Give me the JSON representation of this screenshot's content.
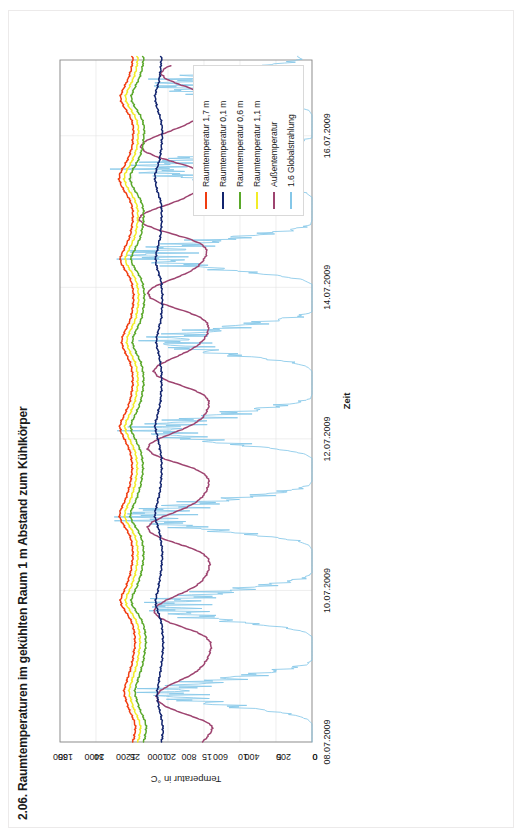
{
  "document": {
    "title": "2.06. Raumtemperaturen im gekühlten Raum 1 m Abstand zum Kühlkörper",
    "orientation": "rotated-90-ccw"
  },
  "legend": {
    "position": "top-right",
    "items": [
      {
        "label": "Raumtemperatur 1,7 m",
        "color": "#f03c10"
      },
      {
        "label": "Raumtemperatur 0,1 m",
        "color": "#12246e"
      },
      {
        "label": "Raumtemperatur 0,6 m",
        "color": "#5aa82a"
      },
      {
        "label": "Raumtemperatur 1,1 m",
        "color": "#f2ec28"
      },
      {
        "label": "Außentemperatur",
        "color": "#9e4470"
      },
      {
        "label": "1.6 Globalstrahlung",
        "color": "#85c7e8"
      }
    ]
  },
  "chart_data": {
    "type": "line",
    "title": "2.06. Raumtemperaturen im gekühlten Raum 1 m Abstand zum Kühlkörper",
    "xlabel": "Zeit",
    "ylabel": "Temperatur in °C",
    "y2label": "",
    "grid": true,
    "legend_position": "top-right",
    "x_ticks": [
      "08.07.2009",
      "10.07.2009",
      "12.07.2009",
      "14.07.2009",
      "16.07.2009"
    ],
    "x_range": [
      "08.07.2009",
      "17.07.2009"
    ],
    "ylim": [
      0,
      35
    ],
    "y_ticks": [
      0,
      5,
      10,
      15,
      20,
      25,
      30,
      35
    ],
    "y2lim": [
      0,
      1600
    ],
    "y2_ticks": [
      0,
      200,
      400,
      600,
      800,
      1000,
      1200,
      1400,
      1600
    ],
    "x_days": [
      0,
      2,
      4,
      6,
      8
    ],
    "series": [
      {
        "name": "Raumtemperatur 1,7 m",
        "color": "#f03c10",
        "axis": "left",
        "unit": "°C",
        "values": [
          24.9,
          24.7,
          24.6,
          24.5,
          24.6,
          24.8,
          25.1,
          25.4,
          25.6,
          25.8,
          26.0,
          26.1,
          26.0,
          25.8,
          25.6,
          25.4,
          25.2,
          25.0,
          24.9,
          24.8,
          24.7,
          24.6,
          24.6,
          24.6,
          24.7,
          24.8,
          25.0,
          25.3,
          25.7,
          26.1,
          26.5,
          26.6,
          26.4,
          26.1,
          25.8,
          25.6,
          25.4,
          25.2,
          25.1,
          25.0,
          24.9,
          24.9,
          24.9,
          25.0,
          25.1,
          25.3,
          25.6,
          26.0,
          26.4,
          26.7,
          26.7,
          26.5,
          26.2,
          25.9,
          25.7,
          25.5,
          25.3,
          25.2,
          25.1,
          25.0,
          25.0,
          25.0,
          25.1,
          25.2,
          25.4,
          25.7,
          26.0,
          26.3,
          26.6,
          26.7,
          26.5,
          26.2,
          25.9,
          25.6,
          25.4,
          25.2,
          25.1,
          25.0,
          24.9,
          24.9,
          24.9,
          25.0,
          25.1,
          25.3,
          25.6,
          25.9,
          26.2,
          26.4,
          26.4,
          26.2,
          25.9,
          25.6,
          25.3,
          25.1,
          25.0,
          24.9,
          24.8,
          24.8,
          24.8,
          24.9,
          25.0,
          25.2,
          25.5,
          25.9,
          26.3,
          26.6,
          26.6,
          26.3,
          26.0,
          25.7,
          25.4,
          25.2,
          25.1,
          25.0,
          24.9,
          24.9,
          24.9,
          25.0,
          25.2,
          25.5,
          25.9,
          26.3,
          26.6,
          26.8,
          26.7,
          26.4,
          26.0,
          25.7,
          25.4,
          25.2,
          25.0,
          24.9,
          24.9,
          24.8,
          24.8,
          24.9,
          25.1,
          25.4,
          25.8,
          26.2,
          26.5,
          26.6,
          26.4,
          26.1,
          25.8,
          25.5,
          25.3,
          25.1,
          25.0,
          24.9
        ]
      },
      {
        "name": "Raumtemperatur 1,1 m",
        "color": "#f2ec28",
        "axis": "left",
        "unit": "°C",
        "values": [
          24.2,
          24.0,
          23.9,
          23.8,
          23.9,
          24.1,
          24.4,
          24.7,
          24.9,
          25.1,
          25.3,
          25.4,
          25.3,
          25.1,
          24.9,
          24.7,
          24.5,
          24.3,
          24.2,
          24.1,
          24.0,
          23.9,
          23.9,
          23.9,
          24.0,
          24.1,
          24.3,
          24.6,
          25.0,
          25.4,
          25.8,
          25.9,
          25.7,
          25.4,
          25.1,
          24.9,
          24.7,
          24.5,
          24.4,
          24.3,
          24.2,
          24.2,
          24.2,
          24.3,
          24.4,
          24.6,
          24.9,
          25.3,
          25.7,
          26.0,
          26.0,
          25.8,
          25.5,
          25.2,
          25.0,
          24.8,
          24.6,
          24.5,
          24.4,
          24.3,
          24.3,
          24.3,
          24.4,
          24.5,
          24.7,
          25.0,
          25.3,
          25.6,
          25.9,
          26.0,
          25.8,
          25.5,
          25.2,
          24.9,
          24.7,
          24.5,
          24.4,
          24.3,
          24.2,
          24.2,
          24.2,
          24.3,
          24.4,
          24.6,
          24.9,
          25.2,
          25.5,
          25.7,
          25.7,
          25.5,
          25.2,
          24.9,
          24.6,
          24.4,
          24.3,
          24.2,
          24.1,
          24.1,
          24.1,
          24.2,
          24.3,
          24.5,
          24.8,
          25.2,
          25.6,
          25.9,
          25.9,
          25.6,
          25.3,
          25.0,
          24.7,
          24.5,
          24.4,
          24.3,
          24.2,
          24.2,
          24.2,
          24.3,
          24.5,
          24.8,
          25.2,
          25.6,
          25.9,
          26.1,
          26.0,
          25.7,
          25.3,
          25.0,
          24.7,
          24.5,
          24.3,
          24.2,
          24.2,
          24.1,
          24.1,
          24.2,
          24.4,
          24.7,
          25.1,
          25.5,
          25.8,
          25.9,
          25.7,
          25.4,
          25.1,
          24.8,
          24.6,
          24.4,
          24.3,
          24.2
        ]
      },
      {
        "name": "Raumtemperatur 0,6 m",
        "color": "#5aa82a",
        "axis": "left",
        "unit": "°C",
        "values": [
          23.4,
          23.2,
          23.1,
          23.0,
          23.1,
          23.3,
          23.6,
          23.9,
          24.1,
          24.3,
          24.5,
          24.6,
          24.5,
          24.3,
          24.1,
          23.9,
          23.7,
          23.5,
          23.4,
          23.3,
          23.2,
          23.1,
          23.1,
          23.1,
          23.2,
          23.3,
          23.5,
          23.8,
          24.2,
          24.6,
          25.0,
          25.1,
          24.9,
          24.6,
          24.3,
          24.1,
          23.9,
          23.7,
          23.6,
          23.5,
          23.4,
          23.4,
          23.4,
          23.5,
          23.6,
          23.8,
          24.1,
          24.5,
          24.9,
          25.2,
          25.2,
          25.0,
          24.7,
          24.4,
          24.2,
          24.0,
          23.8,
          23.7,
          23.6,
          23.5,
          23.5,
          23.5,
          23.6,
          23.7,
          23.9,
          24.2,
          24.5,
          24.8,
          25.1,
          25.2,
          25.0,
          24.7,
          24.4,
          24.1,
          23.9,
          23.7,
          23.6,
          23.5,
          23.4,
          23.4,
          23.4,
          23.5,
          23.6,
          23.8,
          24.1,
          24.4,
          24.7,
          24.9,
          24.9,
          24.7,
          24.4,
          24.1,
          23.8,
          23.6,
          23.5,
          23.4,
          23.3,
          23.3,
          23.3,
          23.4,
          23.5,
          23.7,
          24.0,
          24.4,
          24.8,
          25.1,
          25.1,
          24.8,
          24.5,
          24.2,
          23.9,
          23.7,
          23.6,
          23.5,
          23.4,
          23.4,
          23.4,
          23.5,
          23.7,
          24.0,
          24.4,
          24.8,
          25.1,
          25.3,
          25.2,
          24.9,
          24.5,
          24.2,
          23.9,
          23.7,
          23.5,
          23.4,
          23.4,
          23.3,
          23.3,
          23.4,
          23.6,
          23.9,
          24.3,
          24.7,
          25.0,
          25.1,
          24.9,
          24.6,
          24.3,
          24.0,
          23.8,
          23.6,
          23.5,
          23.4
        ]
      },
      {
        "name": "Raumtemperatur 0,1 m",
        "color": "#12246e",
        "axis": "left",
        "unit": "°C",
        "values": [
          20.9,
          20.8,
          20.7,
          20.7,
          20.8,
          20.9,
          21.0,
          21.2,
          21.3,
          21.4,
          21.5,
          21.5,
          21.4,
          21.3,
          21.2,
          21.1,
          21.0,
          20.9,
          20.8,
          20.8,
          20.7,
          20.7,
          20.7,
          20.7,
          20.8,
          20.8,
          20.9,
          21.1,
          21.3,
          21.5,
          21.7,
          21.7,
          21.6,
          21.4,
          21.3,
          21.2,
          21.1,
          21.0,
          20.9,
          20.9,
          20.8,
          20.8,
          20.8,
          20.9,
          21.0,
          21.1,
          21.2,
          21.4,
          21.6,
          21.8,
          21.8,
          21.7,
          21.5,
          21.4,
          21.2,
          21.1,
          21.0,
          21.0,
          20.9,
          20.9,
          20.9,
          20.9,
          20.9,
          21.0,
          21.1,
          21.2,
          21.4,
          21.5,
          21.7,
          21.8,
          21.7,
          21.5,
          21.4,
          21.2,
          21.1,
          21.0,
          21.0,
          20.9,
          20.9,
          20.9,
          20.9,
          20.9,
          21.0,
          21.1,
          21.2,
          21.3,
          21.5,
          21.6,
          21.6,
          21.5,
          21.3,
          21.2,
          21.0,
          20.9,
          20.9,
          20.8,
          20.8,
          20.8,
          20.8,
          20.9,
          20.9,
          21.0,
          21.2,
          21.4,
          21.6,
          21.7,
          21.7,
          21.6,
          21.4,
          21.3,
          21.1,
          21.0,
          21.0,
          20.9,
          20.9,
          20.9,
          20.9,
          20.9,
          21.0,
          21.2,
          21.4,
          21.6,
          21.7,
          21.8,
          21.8,
          21.6,
          21.4,
          21.2,
          21.1,
          21.0,
          20.9,
          20.9,
          20.8,
          20.8,
          20.8,
          20.9,
          21.0,
          21.2,
          21.4,
          21.6,
          21.7,
          21.8,
          21.7,
          21.5,
          21.3,
          21.2,
          21.1,
          21.0,
          21.0,
          20.9
        ]
      },
      {
        "name": "Außentemperatur",
        "color": "#9e4470",
        "axis": "left",
        "unit": "°C",
        "values": [
          15.2,
          14.6,
          14.1,
          13.8,
          14.2,
          15.6,
          17.4,
          19.2,
          20.6,
          21.4,
          21.6,
          21.2,
          20.3,
          19.0,
          17.6,
          16.4,
          15.6,
          15.0,
          14.6,
          14.3,
          14.1,
          14.0,
          14.2,
          14.8,
          16.0,
          17.8,
          19.6,
          21.0,
          21.8,
          21.9,
          21.3,
          20.2,
          18.8,
          17.4,
          16.2,
          15.4,
          14.9,
          14.5,
          14.3,
          14.2,
          14.4,
          15.0,
          16.2,
          18.0,
          20.0,
          21.6,
          22.6,
          22.8,
          22.2,
          21.0,
          19.4,
          17.8,
          16.5,
          15.6,
          15.0,
          14.6,
          14.4,
          14.3,
          14.6,
          15.4,
          16.8,
          18.8,
          20.8,
          22.2,
          22.8,
          22.6,
          21.6,
          20.1,
          18.5,
          17.0,
          15.9,
          15.1,
          14.7,
          14.4,
          14.3,
          14.5,
          15.2,
          16.6,
          18.4,
          20.2,
          21.5,
          22.0,
          21.6,
          20.5,
          19.1,
          17.7,
          16.5,
          15.6,
          15.0,
          14.6,
          14.4,
          14.4,
          14.8,
          15.8,
          17.4,
          19.4,
          21.2,
          22.4,
          22.8,
          22.4,
          21.2,
          19.6,
          18.0,
          16.7,
          15.8,
          15.2,
          14.8,
          14.6,
          14.8,
          15.6,
          17.2,
          19.4,
          21.6,
          23.2,
          24.0,
          23.8,
          22.6,
          20.8,
          19.0,
          17.5,
          16.4,
          15.6,
          15.1,
          14.8,
          15.0,
          15.8,
          17.6,
          19.8,
          21.8,
          23.2,
          23.8,
          23.4,
          22.2,
          20.5,
          18.8,
          17.3,
          16.2,
          15.4,
          14.9,
          14.6,
          14.5,
          14.8,
          15.6,
          17.2,
          19.0,
          20.4,
          21.0,
          20.6,
          19.4
        ]
      },
      {
        "name": "1.6 Globalstrahlung",
        "color": "#85c7e8",
        "axis": "right",
        "unit": "W/m²",
        "values": [
          0,
          0,
          0,
          0,
          0,
          30,
          120,
          320,
          560,
          740,
          860,
          900,
          840,
          700,
          520,
          330,
          150,
          30,
          0,
          0,
          0,
          0,
          0,
          0,
          40,
          180,
          420,
          640,
          790,
          880,
          900,
          850,
          720,
          540,
          340,
          160,
          40,
          0,
          0,
          0,
          0,
          0,
          0,
          20,
          100,
          300,
          560,
          800,
          960,
          1040,
          1020,
          910,
          740,
          540,
          320,
          130,
          20,
          0,
          0,
          0,
          0,
          0,
          0,
          50,
          220,
          480,
          720,
          880,
          960,
          930,
          830,
          680,
          490,
          290,
          110,
          10,
          0,
          0,
          0,
          0,
          0,
          0,
          30,
          140,
          360,
          600,
          780,
          870,
          880,
          800,
          650,
          460,
          260,
          90,
          0,
          0,
          0,
          0,
          0,
          0,
          0,
          60,
          240,
          500,
          760,
          940,
          1030,
          1010,
          900,
          730,
          530,
          310,
          120,
          10,
          0,
          0,
          0,
          0,
          0,
          0,
          40,
          200,
          460,
          720,
          900,
          990,
          970,
          860,
          700,
          500,
          290,
          100,
          0,
          0,
          0,
          0,
          0,
          0,
          20,
          120,
          340,
          580,
          760,
          850,
          860,
          780,
          630,
          440,
          240,
          80,
          0,
          0,
          0,
          0,
          0,
          0
        ]
      }
    ]
  },
  "axes": {
    "left": {
      "title": "Temperatur in °C",
      "ticks": [
        "35",
        "30",
        "25",
        "20",
        "15",
        "10",
        "5",
        "0"
      ]
    },
    "right": {
      "ticks": [
        "1600",
        "1400",
        "1200",
        "1000",
        "800",
        "600",
        "400",
        "200",
        "0"
      ]
    },
    "bottom": {
      "title": "Zeit",
      "ticks": [
        "08.07.2009",
        "10.07.2009",
        "12.07.2009",
        "14.07.2009",
        "16.07.2009"
      ]
    }
  }
}
